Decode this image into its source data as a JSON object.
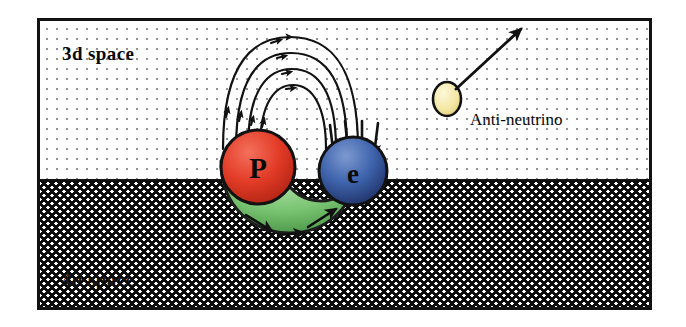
{
  "figure": {
    "regions": [
      {
        "key": "upper",
        "label": "3d space",
        "fill_pattern": "sparse-dots",
        "background": "#ffffff",
        "ink": "#1a1a1a"
      },
      {
        "key": "lower",
        "label": "4d space",
        "fill_pattern": "dense-crosshatch",
        "background": "#ffffff",
        "ink": "#0d0d0d"
      }
    ],
    "border_color": "#121212",
    "particles": [
      {
        "name": "proton",
        "label": "P",
        "color": "#e23b26",
        "shade": "#8c1c0d"
      },
      {
        "name": "electron",
        "label": "e",
        "color": "#3a5fa8",
        "shade": "#17244d"
      },
      {
        "name": "antineutrino",
        "label": "Anti-neutrino",
        "color": "#f6ecae",
        "shade": "#bda83f"
      }
    ],
    "connector": {
      "name": "green-bridge",
      "color": "#76c270",
      "shade": "#2f6b2c",
      "arrow_count": 3
    },
    "field_lines": {
      "count": 4,
      "color": "#121212"
    },
    "converging_arrows": {
      "count": 4,
      "color": "#121212"
    },
    "emission_arrow": {
      "color": "#121212",
      "direction": "up-right"
    }
  }
}
